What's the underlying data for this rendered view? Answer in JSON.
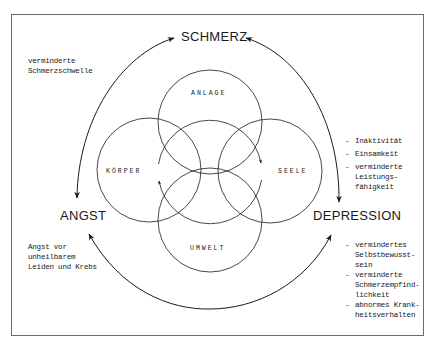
{
  "nodes": {
    "top": "SCHMERZ",
    "left": "ANGST",
    "right": "DEPRESSION"
  },
  "circles": {
    "top": "ANLAGE",
    "left": "KÖRPER",
    "right": "SEELE",
    "bottom": "UMWELT"
  },
  "annotations": {
    "top_left": [
      "verminderte",
      "Schmerzschwelle"
    ],
    "bottom_left": [
      "Angst vor",
      "unheilbarem",
      "Leiden und Krebs"
    ],
    "right_upper": [
      [
        "Inaktivität"
      ],
      [
        "Einsamkeit"
      ],
      [
        "verminderte",
        "Leistungs-",
        "fähigkeit"
      ]
    ],
    "right_lower": [
      [
        "vermindertes",
        "Selbstbewusst-",
        "sein"
      ],
      [
        "verminderte",
        "Schmerzempfind-",
        "lichkeit"
      ],
      [
        "abnormes Krank-",
        "heitsverhalten"
      ]
    ]
  },
  "colors": {
    "line": "#1a1a1a",
    "frame": "#6a6a6a",
    "background": "#ffffff"
  }
}
